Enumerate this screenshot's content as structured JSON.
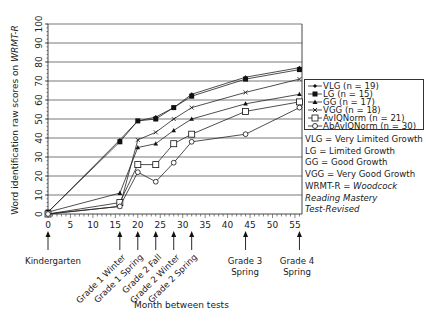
{
  "chart_data": {
    "type": "line",
    "title": "",
    "xlabel": "Month between tests",
    "ylabel": "Word identification raw scores on WRMT-R",
    "ylabel_plain": "Word identification raw scores on ",
    "ylabel_italic": "WRMT-R",
    "xlim": [
      0,
      56
    ],
    "ylim": [
      0,
      100
    ],
    "x_ticks": [
      0,
      5,
      10,
      15,
      20,
      25,
      30,
      35,
      40,
      45,
      50,
      55
    ],
    "y_ticks": [
      0,
      10,
      20,
      30,
      40,
      50,
      60,
      70,
      80,
      90,
      100
    ],
    "grid": "horizontal",
    "legend_position": "right",
    "x": [
      0,
      16,
      20,
      24,
      28,
      32,
      44,
      56
    ],
    "series": [
      {
        "name": "VLG (n = 19)",
        "marker": "small-diamond-filled",
        "values": [
          1,
          39,
          49,
          51,
          56,
          63,
          72,
          77
        ]
      },
      {
        "name": "LG (n = 15)",
        "marker": "square-filled",
        "values": [
          1,
          38,
          49,
          50,
          56,
          62,
          71,
          76
        ]
      },
      {
        "name": "GG (n = 17)",
        "marker": "triangle-filled",
        "values": [
          1,
          11,
          35,
          37,
          44,
          50,
          58,
          63
        ]
      },
      {
        "name": "VGG (n = 18)",
        "marker": "cross",
        "values": [
          0,
          4,
          39,
          43,
          50,
          56,
          64,
          71
        ]
      },
      {
        "name": "AvIQNorm (n = 21)",
        "marker": "square-open",
        "values": [
          0,
          6,
          26,
          26,
          37,
          42,
          54,
          59
        ]
      },
      {
        "name": "AbAvIQNorm (n = 30)",
        "marker": "circle-open",
        "values": [
          0,
          4,
          22,
          17,
          27,
          38,
          42,
          56
        ]
      }
    ],
    "events": [
      {
        "x": 0,
        "label": "Kindergarten",
        "style": "horizontal"
      },
      {
        "x": 16,
        "label": "Grade 1 Winter",
        "style": "rotated"
      },
      {
        "x": 20,
        "label": "Grade 1 Spring",
        "style": "rotated"
      },
      {
        "x": 24,
        "label": "Grade 2 Fall",
        "style": "rotated"
      },
      {
        "x": 28,
        "label": "Grade 2 Winter",
        "style": "rotated"
      },
      {
        "x": 32,
        "label": "Grade 2 Spring",
        "style": "rotated"
      },
      {
        "x": 44,
        "label": "Grade 3\nSpring",
        "line1": "Grade 3",
        "line2": "Spring",
        "style": "stacked"
      },
      {
        "x": 56,
        "label": "Grade 4\nSpring",
        "line1": "Grade 4",
        "line2": "Spring",
        "style": "stacked"
      }
    ],
    "notes": [
      {
        "text": "VLG = Very Limited Growth"
      },
      {
        "text": "LG = Limited Growth"
      },
      {
        "text": "GG = Good Growth"
      },
      {
        "text": "VGG = Very Good Growth"
      },
      {
        "text_plain": "WRMT-R = ",
        "text_italic": "Woodcock"
      },
      {
        "text_italic": "Reading Mastery"
      },
      {
        "text_italic": "Test-Revised"
      }
    ]
  }
}
